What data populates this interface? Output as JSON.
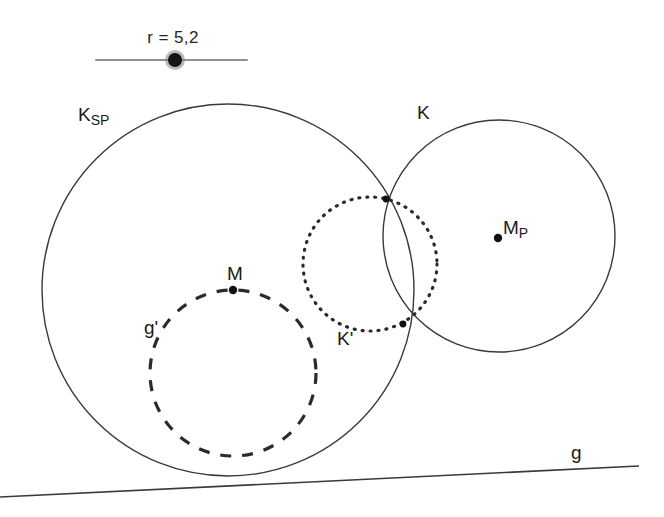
{
  "app": {
    "background_color": "#ffffff",
    "stroke_color": "#3a3a3a",
    "label_color": "#1a1a1a"
  },
  "slider": {
    "name": "r",
    "value_text": "r = 5,2",
    "value": 5.2,
    "min": 0,
    "max": 10,
    "handle_fraction": 0.52,
    "track_color": "#8f8f8f",
    "handle_color": "#141414"
  },
  "labels": {
    "k_sp_main": "K",
    "k_sp_sub": "SP",
    "k": "K",
    "m_p_main": "M",
    "m_p_sub": "P",
    "m": "M",
    "g_prime": "g'",
    "k_prime": "K'",
    "g": "g"
  },
  "chart_data": {
    "type": "diagram",
    "title": "",
    "xlim": [
      0,
      664
    ],
    "ylim": [
      0,
      517
    ],
    "grid": false,
    "legend": false,
    "circles": [
      {
        "label": "K_SP",
        "cx": 228,
        "cy": 290,
        "r": 186,
        "style": "solid",
        "stroke": "#3a3a3a",
        "stroke_width": 1.4
      },
      {
        "label": "K",
        "cx": 499,
        "cy": 236,
        "r": 116,
        "style": "solid",
        "stroke": "#3a3a3a",
        "stroke_width": 1.4
      },
      {
        "label": "K'",
        "cx": 370,
        "cy": 264,
        "r": 67,
        "style": "dotted",
        "stroke": "#2b2b2b",
        "stroke_width": 3.2,
        "dash": "1 7"
      },
      {
        "label": "g'",
        "cx": 233,
        "cy": 373,
        "r": 83,
        "style": "dashed",
        "stroke": "#2b2b2b",
        "stroke_width": 3.2,
        "dash": "11 11"
      }
    ],
    "lines": [
      {
        "label": "g",
        "x1": 0,
        "y1": 497,
        "x2": 639,
        "y2": 466,
        "style": "solid",
        "stroke": "#3a3a3a",
        "stroke_width": 1.6
      }
    ],
    "points": [
      {
        "label": "M_P",
        "x": 498,
        "y": 238,
        "r": 4.2,
        "fill": "#111111"
      },
      {
        "label": "M",
        "x": 233,
        "y": 290,
        "r": 4.2,
        "fill": "#111111"
      },
      {
        "label": "S1",
        "x": 386,
        "y": 199,
        "r": 3.4,
        "fill": "#111111"
      },
      {
        "label": "S2",
        "x": 403,
        "y": 324,
        "r": 3.4,
        "fill": "#111111"
      }
    ]
  }
}
